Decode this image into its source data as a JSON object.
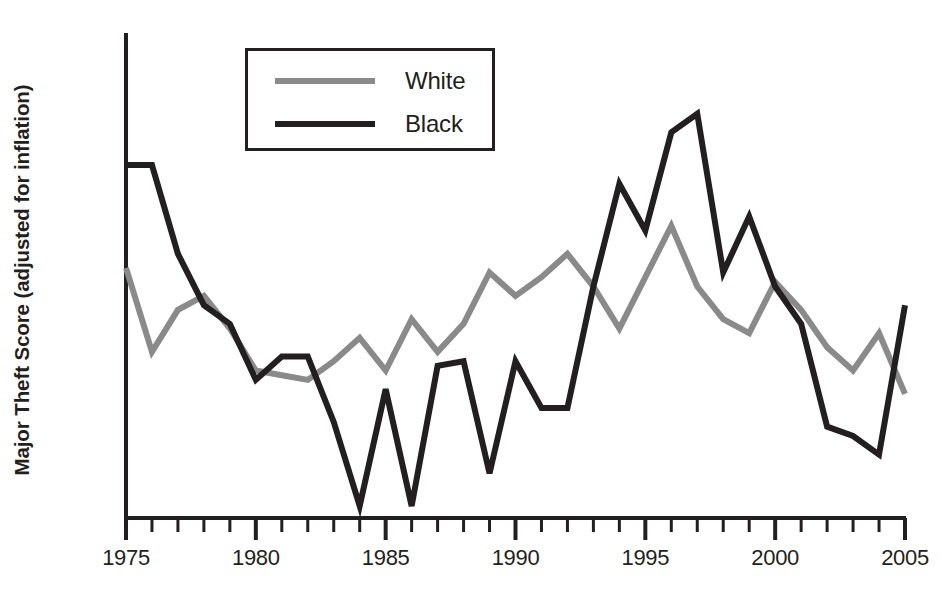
{
  "figure": {
    "title": "",
    "y_axis_label": "Major Theft Score (adjusted for inflation)"
  },
  "legend": {
    "items": [
      {
        "label": "White",
        "color": "#8a8a8a"
      },
      {
        "label": "Black",
        "color": "#231f20"
      }
    ]
  },
  "axis": {
    "x_tick_labels": [
      "1975",
      "1980",
      "1985",
      "1990",
      "1995",
      "2000",
      "2005"
    ]
  },
  "chart_data": {
    "type": "line",
    "title": "",
    "xlabel": "",
    "ylabel": "Major Theft Score (adjusted for inflation)",
    "xlim": [
      1975,
      2005
    ],
    "ylim": [
      0,
      100
    ],
    "grid": false,
    "legend_position": "top-center",
    "x_ticks_major": [
      1975,
      1980,
      1985,
      1990,
      1995,
      2000,
      2005
    ],
    "x_ticks_minor_step": 1,
    "y_axis_ticks_shown": false,
    "x": [
      1975,
      1976,
      1977,
      1978,
      1979,
      1980,
      1981,
      1982,
      1983,
      1984,
      1985,
      1986,
      1987,
      1988,
      1989,
      1990,
      1991,
      1992,
      1993,
      1994,
      1995,
      1996,
      1997,
      1998,
      1999,
      2000,
      2001,
      2002,
      2003,
      2004,
      2005
    ],
    "series": [
      {
        "name": "White",
        "color": "#8a8a8a",
        "values": [
          51,
          33,
          42,
          45,
          38,
          29,
          28,
          27,
          31,
          36,
          29,
          40,
          33,
          39,
          50,
          45,
          49,
          54,
          47,
          38,
          49,
          60,
          47,
          40,
          37,
          48,
          42,
          34,
          29,
          37,
          24
        ]
      },
      {
        "name": "Black",
        "color": "#231f20",
        "values": [
          73,
          73,
          54,
          43,
          39,
          27,
          32,
          32,
          18,
          0,
          25,
          0,
          30,
          31,
          7,
          31,
          21,
          21,
          47,
          69,
          59,
          80,
          84,
          50,
          62,
          47,
          39,
          17,
          15,
          11,
          43
        ]
      }
    ]
  }
}
